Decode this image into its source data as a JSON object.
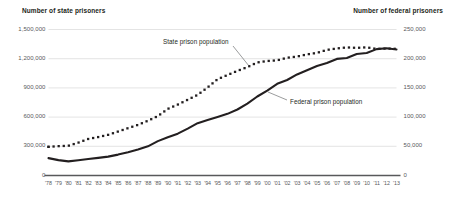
{
  "chart_data": {
    "type": "line",
    "title": "",
    "subtitle": "",
    "xlabel": "",
    "ylabel": "Number of state prisoners",
    "y2label": "Number of federal prisoners",
    "grid": true,
    "legend_position": "inline-annotation",
    "x": [
      "'78",
      "'79",
      "'80",
      "'81",
      "'82",
      "'83",
      "'84",
      "'85",
      "'86",
      "'87",
      "'88",
      "'89",
      "'90",
      "'91",
      "'92",
      "'93",
      "'94",
      "'95",
      "'96",
      "'97",
      "'98",
      "'99",
      "'00",
      "'01",
      "'02",
      "'03",
      "'04",
      "'05",
      "'06",
      "'07",
      "'08",
      "'09",
      "'10",
      "'11",
      "'12",
      "'13"
    ],
    "xtick_labels": [
      "'78",
      "'79",
      "'80",
      "'81",
      "'82",
      "'83",
      "'84",
      "'85",
      "'86",
      "'87",
      "'88",
      "'89",
      "'90",
      "'91",
      "'92",
      "'93",
      "'94",
      "'95",
      "'96",
      "'97",
      "'98",
      "'99",
      "'00",
      "'01",
      "'02",
      "'03",
      "'04",
      "'05",
      "'06",
      "'07",
      "'08",
      "'09",
      "'10",
      "'11",
      "'12",
      "'13"
    ],
    "ytick_labels": [
      "1,500,000",
      "1,200,000",
      "900,000",
      "600,000",
      "300,000",
      "0"
    ],
    "ytick_values": [
      1500000,
      1200000,
      900000,
      600000,
      300000,
      0
    ],
    "ylim": [
      0,
      1500000
    ],
    "y2tick_labels": [
      "250,000",
      "200,000",
      "150,000",
      "100,000",
      "50,000",
      "0"
    ],
    "y2tick_values": [
      250000,
      200000,
      150000,
      100000,
      50000,
      0
    ],
    "y2lim": [
      0,
      250000
    ],
    "series": [
      {
        "name": "State prison population",
        "axis": "left",
        "style": "dotted",
        "color": "#231f20",
        "annotation": "State prison population",
        "values": [
          294396,
          301470,
          305458,
          337570,
          375603,
          394953,
          417826,
          451812,
          486655,
          520336,
          562605,
          610399,
          684544,
          728605,
          778495,
          828566,
          904647,
          989004,
          1032440,
          1074809,
          1113676,
          1161490,
          1176269,
          1183112,
          1209640,
          1222135,
          1244311,
          1259905,
          1290291,
          1305264,
          1316019,
          1311156,
          1316858,
          1300039,
          1304347,
          1301266
        ]
      },
      {
        "name": "Federal prison population",
        "axis": "right",
        "style": "solid",
        "color": "#231f20",
        "annotation": "Federal prison population",
        "values": [
          29803,
          26371,
          24252,
          26195,
          28133,
          30214,
          32317,
          35781,
          39781,
          44408,
          49928,
          58838,
          65526,
          71608,
          80259,
          89587,
          95034,
          100250,
          105544,
          112973,
          123041,
          135246,
          145416,
          156993,
          163528,
          173059,
          180328,
          187618,
          192584,
          199618,
          201280,
          208118,
          209771,
          216362,
          217815,
          215866
        ]
      }
    ]
  }
}
